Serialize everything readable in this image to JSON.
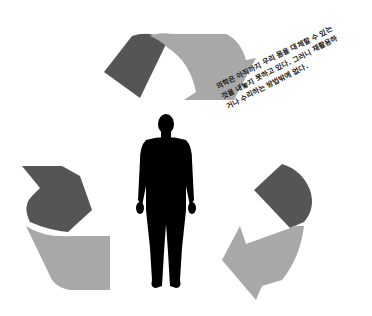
{
  "illustration": {
    "subject": "human-silhouette",
    "arrows": [
      {
        "position": "top",
        "dark_color": "#555555",
        "light_color": "#a8a8a8"
      },
      {
        "position": "left",
        "dark_color": "#555555",
        "light_color": "#a8a8a8"
      },
      {
        "position": "right",
        "dark_color": "#555555",
        "light_color": "#a8a8a8"
      }
    ],
    "silhouette_color": "#000000"
  },
  "caption": {
    "lines": [
      "의학은 아직까지 우리 몸을 대체할 수 있는",
      "것을 내놓지 못하고 있다. 그러니 재활용하",
      "거나 수리하는 방법밖에 없다."
    ]
  }
}
